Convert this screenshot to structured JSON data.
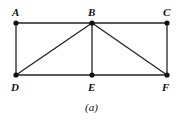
{
  "diagram": {
    "type": "graph",
    "caption": "(a)",
    "nodes": [
      {
        "id": "A",
        "x": 16,
        "y": 23
      },
      {
        "id": "B",
        "x": 92,
        "y": 23
      },
      {
        "id": "C",
        "x": 167,
        "y": 23
      },
      {
        "id": "D",
        "x": 16,
        "y": 75
      },
      {
        "id": "E",
        "x": 92,
        "y": 75
      },
      {
        "id": "F",
        "x": 167,
        "y": 75
      }
    ],
    "edges": [
      [
        "A",
        "B"
      ],
      [
        "B",
        "C"
      ],
      [
        "A",
        "D"
      ],
      [
        "C",
        "F"
      ],
      [
        "D",
        "E"
      ],
      [
        "E",
        "F"
      ],
      [
        "B",
        "D"
      ],
      [
        "B",
        "E"
      ],
      [
        "B",
        "F"
      ]
    ],
    "labels": {
      "A": "A",
      "B": "B",
      "C": "C",
      "D": "D",
      "E": "E",
      "F": "F"
    }
  }
}
